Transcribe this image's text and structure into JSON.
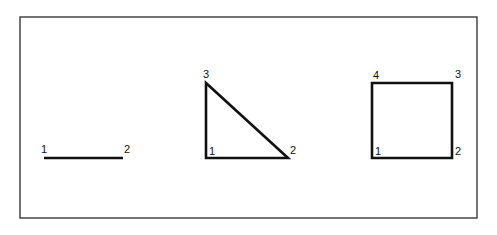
{
  "canvas": {
    "width": 497,
    "height": 235,
    "background_color": "#ffffff",
    "stroke_color": "#111111",
    "frame_color": "#3a3a3a"
  },
  "frame": {
    "x": 20,
    "y": 17,
    "width": 457,
    "height": 201
  },
  "figures": [
    {
      "name": "line-segment",
      "type": "polyline",
      "stroke_width": 2.4,
      "points": "44,158 123,158",
      "vertices": [
        {
          "label": "1",
          "x": 44,
          "y": 158,
          "label_x": 44,
          "label_y": 153
        },
        {
          "label": "2",
          "x": 123,
          "y": 158,
          "label_x": 124,
          "label_y": 153
        }
      ]
    },
    {
      "name": "right-triangle",
      "type": "polygon",
      "stroke_width": 2.6,
      "points": "206,83 206,158 288,158",
      "vertices": [
        {
          "label": "3",
          "x": 206,
          "y": 83,
          "label_x": 206,
          "label_y": 78
        },
        {
          "label": "1",
          "x": 206,
          "y": 158,
          "label_x": 209,
          "label_y": 155
        },
        {
          "label": "2",
          "x": 288,
          "y": 158,
          "label_x": 290,
          "label_y": 154
        }
      ]
    },
    {
      "name": "square",
      "type": "polygon",
      "stroke_width": 2.6,
      "points": "372,83 452,83 452,158 372,158",
      "vertices": [
        {
          "label": "4",
          "x": 372,
          "y": 83,
          "label_x": 373,
          "label_y": 79
        },
        {
          "label": "3",
          "x": 452,
          "y": 83,
          "label_x": 455,
          "label_y": 78
        },
        {
          "label": "2",
          "x": 452,
          "y": 158,
          "label_x": 455,
          "label_y": 155
        },
        {
          "label": "1",
          "x": 372,
          "y": 158,
          "label_x": 375,
          "label_y": 155
        }
      ]
    }
  ]
}
